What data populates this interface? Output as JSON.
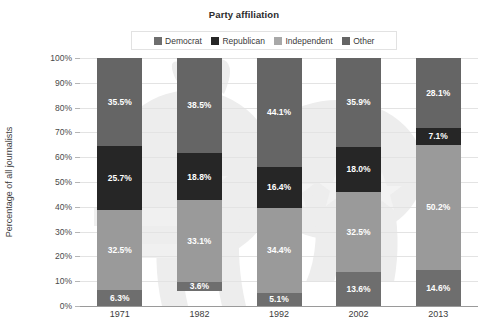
{
  "chart_data": {
    "type": "bar",
    "subtype": "stacked-100-percent",
    "title": "Party affiliation",
    "xlabel": "",
    "ylabel": "Percentage of all journalists",
    "categories": [
      "1971",
      "1982",
      "1992",
      "2002",
      "2013"
    ],
    "ylim": [
      0,
      100
    ],
    "ytick_labels": [
      "0%",
      "10%",
      "20%",
      "30%",
      "40%",
      "50%",
      "60%",
      "70%",
      "80%",
      "90%",
      "100%"
    ],
    "ytick_values": [
      0,
      10,
      20,
      30,
      40,
      50,
      60,
      70,
      80,
      90,
      100
    ],
    "grid": true,
    "legend_position": "top-center",
    "stack_order_bottom_to_top": [
      "Democrat",
      "Independent",
      "Republican",
      "Other"
    ],
    "series": [
      {
        "name": "Democrat",
        "color": "#6e6e6e",
        "values": [
          6.3,
          3.6,
          5.1,
          13.6,
          14.6
        ],
        "labels": [
          "6.3%",
          "3.6%",
          "5.1%",
          "13.6%",
          "14.6%"
        ]
      },
      {
        "name": "Republican",
        "color": "#262626",
        "values": [
          25.7,
          18.8,
          16.4,
          18.0,
          7.1
        ],
        "labels": [
          "25.7%",
          "18.8%",
          "16.4%",
          "18.0%",
          "7.1%"
        ]
      },
      {
        "name": "Independent",
        "color": "#9a9a9a",
        "values": [
          32.5,
          33.1,
          34.4,
          32.5,
          50.2
        ],
        "labels": [
          "32.5%",
          "33.1%",
          "34.4%",
          "32.5%",
          "50.2%"
        ]
      },
      {
        "name": "Other",
        "color": "#656565",
        "values": [
          35.5,
          38.5,
          44.1,
          35.9,
          28.1
        ],
        "labels": [
          "35.5%",
          "38.5%",
          "44.1%",
          "35.9%",
          "28.1%"
        ]
      }
    ]
  },
  "legend": {
    "items": [
      {
        "label": "Democrat",
        "color": "#6e6e6e",
        "icon": "square-swatch-icon"
      },
      {
        "label": "Republican",
        "color": "#262626",
        "icon": "square-swatch-icon"
      },
      {
        "label": "Independent",
        "color": "#a8a8a8",
        "icon": "square-swatch-icon"
      },
      {
        "label": "Other",
        "color": "#656565",
        "icon": "square-swatch-icon"
      }
    ]
  },
  "colors": {
    "background": "#ffffff",
    "gridline": "#e3e3e3",
    "axis": "#9a9a9a",
    "tick_text": "#4a4a4a",
    "title_text": "#2b2b2b",
    "bar_label_text": "#ffffff",
    "watermark": "#ededed"
  }
}
